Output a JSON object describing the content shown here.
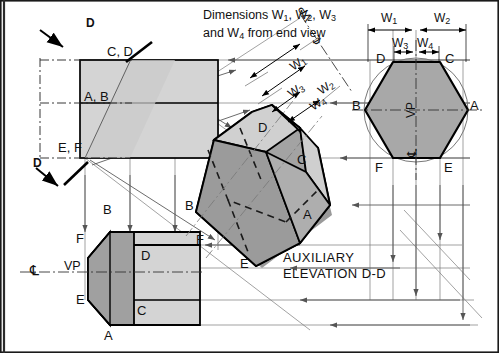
{
  "drawing": {
    "title": "Auxiliary elevation of a hexagonal prism",
    "note": {
      "line1": "Dimensions W1, W2, W3",
      "line2": "and W4 from end view",
      "line1_a": "Dimensions W",
      "line1_b": ", W",
      "line1_c": ", W",
      "line1_d": "",
      "line2_a": "and W",
      "line2_b": " from end view"
    },
    "view_titles": {
      "auxiliary_line1": "AUXILIARY",
      "auxiliary_line2": "ELEVATION D-D"
    },
    "section_marks": [
      {
        "name": "section-arrow-top",
        "label": "D"
      },
      {
        "name": "section-arrow-bottom",
        "label": "D"
      }
    ],
    "dimensions": {
      "w1": "W",
      "w1_sub": "1",
      "w2": "W",
      "w2_sub": "2",
      "w3": "W",
      "w3_sub": "3",
      "w4": "W",
      "w4_sub": "4"
    },
    "vp_labels": {
      "plan_vp": "VP",
      "endview_vp": "VP",
      "aux_vp": "VP"
    },
    "centreline_symbol": "℄",
    "elevation_labels": {
      "cd": "C, D",
      "ab": "A, B",
      "ef": "E, F"
    },
    "aux_vertices": {
      "a": "A",
      "b": "B",
      "c": "C",
      "d": "D",
      "e": "E",
      "f": "F"
    },
    "endview_vertices": {
      "a": "A",
      "b": "B",
      "c": "C",
      "d": "D",
      "e": "E",
      "f": "F"
    },
    "plan_vertices": {
      "a": "A",
      "b": "B",
      "c": "C",
      "d": "D",
      "e": "E",
      "f": "F"
    },
    "colors": {
      "line": "#000000",
      "thin_line": "#6d6d6d",
      "face_light": "#d4d4d4",
      "face_mid": "#bcbcbc",
      "face_dark": "#a0a0a0",
      "face_darker": "#8e8e8e",
      "background": "#ffffff",
      "border": "#1a1a1a"
    }
  }
}
